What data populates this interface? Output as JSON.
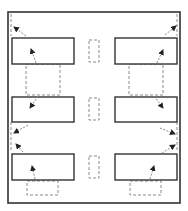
{
  "diagram": {
    "colors": {
      "solid": "#333333",
      "dashed": "#8a8a8a",
      "arrow": "#222222",
      "background": "#ffffff"
    },
    "frame": {
      "x": 8,
      "y": 12,
      "w": 172,
      "h": 191
    },
    "solid_boxes": [
      {
        "id": "left-row1",
        "x": 12,
        "y": 38,
        "w": 62,
        "h": 26
      },
      {
        "id": "right-row1",
        "x": 115,
        "y": 38,
        "w": 62,
        "h": 26
      },
      {
        "id": "left-row2",
        "x": 12,
        "y": 97,
        "w": 62,
        "h": 25
      },
      {
        "id": "right-row2",
        "x": 115,
        "y": 97,
        "w": 62,
        "h": 25
      },
      {
        "id": "left-row3",
        "x": 12,
        "y": 154,
        "w": 62,
        "h": 26
      },
      {
        "id": "right-row3",
        "x": 115,
        "y": 154,
        "w": 62,
        "h": 26
      }
    ],
    "dashed_boxes": [
      {
        "id": "left-gap-12",
        "x": 26,
        "y": 64,
        "w": 34,
        "h": 31
      },
      {
        "id": "right-gap-12",
        "x": 129,
        "y": 64,
        "w": 34,
        "h": 31
      },
      {
        "id": "left-bottom",
        "x": 27,
        "y": 181,
        "w": 31,
        "h": 14
      },
      {
        "id": "right-bottom",
        "x": 130,
        "y": 181,
        "w": 31,
        "h": 14
      },
      {
        "id": "mid-row1",
        "x": 89,
        "y": 40,
        "w": 10,
        "h": 22
      },
      {
        "id": "mid-row2",
        "x": 89,
        "y": 98,
        "w": 10,
        "h": 22
      },
      {
        "id": "mid-row3",
        "x": 89,
        "y": 156,
        "w": 10,
        "h": 22
      }
    ],
    "dashed_lines": [
      {
        "id": "left-edge-top",
        "x1": 11,
        "y1": 14,
        "x2": 11,
        "y2": 36
      },
      {
        "id": "left-edge-mid",
        "x1": 11,
        "y1": 122,
        "x2": 11,
        "y2": 152
      },
      {
        "id": "right-edge-top",
        "x1": 177,
        "y1": 14,
        "x2": 177,
        "y2": 36
      },
      {
        "id": "right-edge-mid",
        "x1": 177,
        "y1": 122,
        "x2": 177,
        "y2": 152
      }
    ],
    "arrows": [
      {
        "id": "a1",
        "x1": 26,
        "y1": 36,
        "x2": 14,
        "y2": 27
      },
      {
        "id": "a2",
        "x1": 36,
        "y1": 63,
        "x2": 31,
        "y2": 49
      },
      {
        "id": "a3",
        "x1": 38,
        "y1": 96,
        "x2": 30,
        "y2": 108
      },
      {
        "id": "a4",
        "x1": 28,
        "y1": 125,
        "x2": 14,
        "y2": 133
      },
      {
        "id": "a5",
        "x1": 23,
        "y1": 152,
        "x2": 16,
        "y2": 144
      },
      {
        "id": "a6",
        "x1": 35,
        "y1": 179,
        "x2": 32,
        "y2": 166
      },
      {
        "id": "b1",
        "x1": 165,
        "y1": 35,
        "x2": 176,
        "y2": 26
      },
      {
        "id": "b2",
        "x1": 157,
        "y1": 63,
        "x2": 163,
        "y2": 50
      },
      {
        "id": "b3",
        "x1": 154,
        "y1": 96,
        "x2": 163,
        "y2": 108
      },
      {
        "id": "b4",
        "x1": 160,
        "y1": 128,
        "x2": 175,
        "y2": 134
      },
      {
        "id": "b5",
        "x1": 162,
        "y1": 153,
        "x2": 175,
        "y2": 145
      },
      {
        "id": "b6",
        "x1": 150,
        "y1": 179,
        "x2": 154,
        "y2": 166
      }
    ]
  }
}
